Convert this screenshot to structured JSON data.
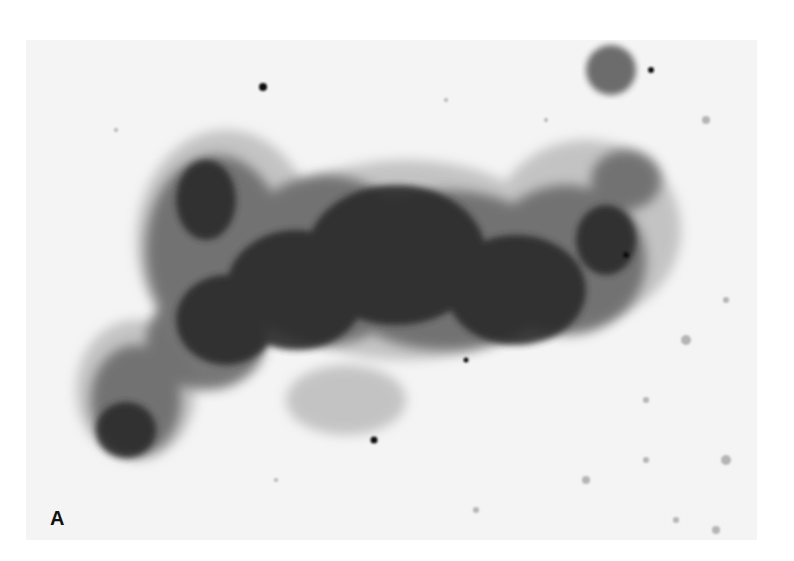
{
  "figure": {
    "panel_label": "A",
    "colors": {
      "background": "#f4f4f4",
      "dark_mass": "#2a2a2a",
      "mid_tone": "#6a6a6a",
      "light_tone": "#b5b5b5"
    }
  }
}
